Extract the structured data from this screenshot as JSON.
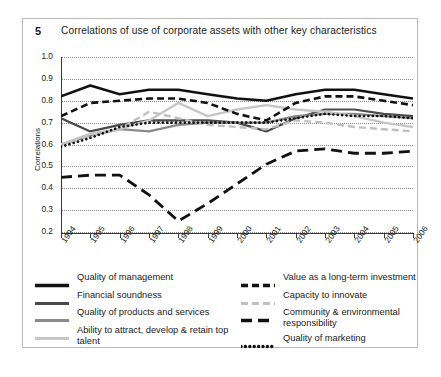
{
  "figure": {
    "number": "5",
    "title": "Correlations of use of corporate assets with other key characteristics"
  },
  "chart_data": {
    "type": "line",
    "title": "Correlations of use of corporate assets with other key characteristics",
    "xlabel": "",
    "ylabel": "Correlations",
    "ylim": [
      0.2,
      1.0
    ],
    "ytick_labels": [
      "1.0",
      "0.9",
      "0.8",
      "0.7",
      "0.6",
      "0.5",
      "0.4",
      "0.3",
      "0.2"
    ],
    "grid": true,
    "legend_position": "below",
    "categories": [
      "1994",
      "1995",
      "1996",
      "1997",
      "1998",
      "1999",
      "2000",
      "2001",
      "2002",
      "2003",
      "2004",
      "2005",
      "2006"
    ],
    "series": [
      {
        "name": "Quality of management",
        "style": "solid",
        "color": "#111111",
        "width": 2.6,
        "values": [
          0.82,
          0.87,
          0.83,
          0.85,
          0.85,
          0.83,
          0.81,
          0.8,
          0.83,
          0.85,
          0.85,
          0.83,
          0.81
        ]
      },
      {
        "name": "Financial soundness",
        "style": "solid",
        "color": "#4a4a4a",
        "width": 2.2,
        "values": [
          0.72,
          0.66,
          0.69,
          0.71,
          0.71,
          0.71,
          0.7,
          0.66,
          0.72,
          0.76,
          0.76,
          0.74,
          0.73
        ]
      },
      {
        "name": "Quality of products and services",
        "style": "solid",
        "color": "#8a8a8a",
        "width": 2.2,
        "values": [
          0.6,
          0.64,
          0.67,
          0.66,
          0.69,
          0.7,
          0.7,
          0.7,
          0.73,
          0.74,
          0.74,
          0.73,
          0.72
        ]
      },
      {
        "name": "Ability to attract, develop & retain top talent",
        "style": "solid",
        "color": "#c6c6c6",
        "width": 2.4,
        "values": [
          0.6,
          0.65,
          0.67,
          0.71,
          0.79,
          0.73,
          0.76,
          0.78,
          0.76,
          0.75,
          0.73,
          0.7,
          0.68
        ]
      },
      {
        "name": "Value as a long-term investment",
        "style": "dashed",
        "color": "#111111",
        "width": 2.6,
        "values": [
          0.73,
          0.79,
          0.8,
          0.81,
          0.81,
          0.79,
          0.74,
          0.71,
          0.79,
          0.82,
          0.82,
          0.8,
          0.78
        ]
      },
      {
        "name": "Capacity to innovate",
        "style": "dashed",
        "color": "#c0c0c0",
        "width": 2.4,
        "values": [
          0.6,
          0.64,
          0.67,
          0.75,
          0.72,
          0.69,
          0.68,
          0.67,
          0.71,
          0.7,
          0.68,
          0.67,
          0.66
        ]
      },
      {
        "name": "Community & environmental responsibility",
        "style": "longdash",
        "color": "#111111",
        "width": 2.8,
        "values": [
          0.45,
          0.46,
          0.46,
          0.37,
          0.25,
          0.33,
          0.42,
          0.51,
          0.57,
          0.58,
          0.56,
          0.56,
          0.57
        ]
      },
      {
        "name": "Quality of marketing",
        "style": "dotted",
        "color": "#111111",
        "width": 2.6,
        "values": [
          0.59,
          0.63,
          0.68,
          0.7,
          0.7,
          0.7,
          0.7,
          0.7,
          0.72,
          0.74,
          0.73,
          0.73,
          0.72
        ]
      }
    ]
  },
  "legend": {
    "left": [
      {
        "label": "Quality of management",
        "swatch": "solid-black-thick"
      },
      {
        "label": "Financial soundness",
        "swatch": "solid-darkgray"
      },
      {
        "label": "Quality of products and services",
        "swatch": "solid-midgray"
      },
      {
        "label": "Ability to attract, develop & retain top talent",
        "swatch": "solid-lightgray"
      }
    ],
    "right": [
      {
        "label": "Value as a long-term investment",
        "swatch": "dashed-black"
      },
      {
        "label": "Capacity to innovate",
        "swatch": "dashed-lightgray"
      },
      {
        "label": "Community & environmental responsibility",
        "swatch": "longdash-black"
      },
      {
        "label": "Quality of marketing",
        "swatch": "dotted-black"
      }
    ]
  }
}
